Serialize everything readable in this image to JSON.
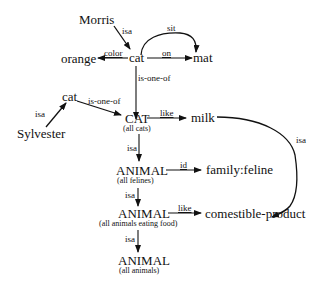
{
  "diagram": {
    "type": "semantic-network",
    "nodes": {
      "morris": {
        "label": "Morris"
      },
      "cat1": {
        "label": "cat"
      },
      "orange": {
        "label": "orange"
      },
      "mat": {
        "label": "mat"
      },
      "cat2": {
        "label": "cat"
      },
      "sylvester": {
        "label": "Sylvester"
      },
      "CAT": {
        "label": "CAT",
        "sublabel": "(all cats)"
      },
      "milk": {
        "label": "milk"
      },
      "animal_felines": {
        "label": "ANIMAL",
        "sublabel": "(all felines)"
      },
      "family_feline": {
        "label": "family:feline"
      },
      "animal_eating": {
        "label": "ANIMAL",
        "sublabel": "(all animals eating food)"
      },
      "comestible": {
        "label": "comestible-product"
      },
      "animal_all": {
        "label": "ANIMAL",
        "sublabel": "(all animals)"
      }
    },
    "edges": [
      {
        "from": "morris",
        "to": "cat1",
        "label": "isa"
      },
      {
        "from": "cat1",
        "to": "mat",
        "label": "sit"
      },
      {
        "from": "cat1",
        "to": "mat",
        "label": "on"
      },
      {
        "from": "cat1",
        "to": "orange",
        "label": "color"
      },
      {
        "from": "cat1",
        "to": "CAT",
        "label": "is-one-of"
      },
      {
        "from": "sylvester",
        "to": "cat2",
        "label": "isa"
      },
      {
        "from": "cat2",
        "to": "CAT",
        "label": "is-one-of"
      },
      {
        "from": "CAT",
        "to": "milk",
        "label": "like"
      },
      {
        "from": "CAT",
        "to": "animal_felines",
        "label": "isa"
      },
      {
        "from": "animal_felines",
        "to": "family_feline",
        "label": "id"
      },
      {
        "from": "milk",
        "to": "comestible",
        "label": "isa"
      },
      {
        "from": "animal_felines",
        "to": "animal_eating",
        "label": "isa"
      },
      {
        "from": "animal_eating",
        "to": "comestible",
        "label": "like"
      },
      {
        "from": "animal_eating",
        "to": "animal_all",
        "label": "isa"
      }
    ]
  }
}
